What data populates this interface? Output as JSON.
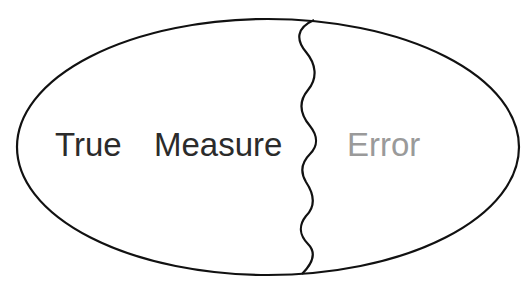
{
  "diagram": {
    "labels": {
      "true": "True",
      "measure": "Measure",
      "error": "Error"
    },
    "colors": {
      "outline": "#111111",
      "true_measure_text": "#2b2b2b",
      "error_text": "#9a9a9a"
    }
  }
}
